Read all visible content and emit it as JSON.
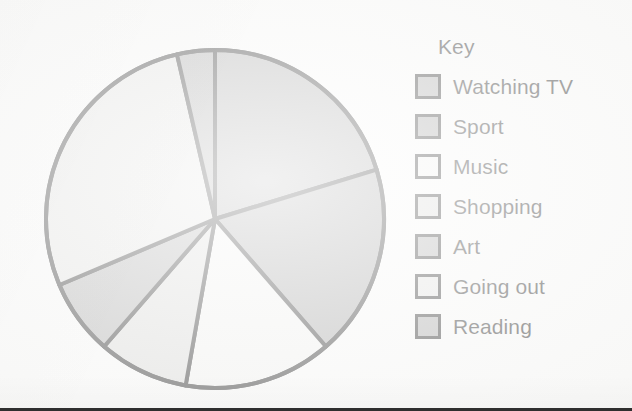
{
  "legend": {
    "title": "Key",
    "items": [
      {
        "label": "Watching TV",
        "swatch_color": "#a4a4a4"
      },
      {
        "label": "Sport",
        "swatch_color": "#9d9d9d"
      },
      {
        "label": "Music",
        "swatch_color": "#f4f4f2"
      },
      {
        "label": "Shopping",
        "swatch_color": "#d9d9d7"
      },
      {
        "label": "Art",
        "swatch_color": "#a7a7a7"
      },
      {
        "label": "Going out",
        "swatch_color": "#e2e2e0"
      },
      {
        "label": "Reading",
        "swatch_color": "#a2a2a2"
      }
    ]
  },
  "chart_data": {
    "type": "pie",
    "title": "",
    "legend_title": "Key",
    "legend_position": "right",
    "grid": false,
    "start_angle_deg": 0,
    "direction": "clockwise",
    "center_px": [
      214,
      219
    ],
    "radius_px": 171,
    "outline_color": "#111111",
    "outline_width_px": 4,
    "categories": [
      "Watching TV",
      "Sport",
      "Music",
      "Shopping",
      "Art",
      "Going out",
      "Reading"
    ],
    "angles_deg": [
      73,
      66,
      51,
      31,
      26,
      100,
      13
    ],
    "values_percent": [
      20.3,
      18.3,
      14.2,
      8.6,
      7.2,
      27.8,
      3.6
    ],
    "slice_boundaries_deg": [
      0,
      73,
      139,
      190,
      221,
      247,
      347,
      360
    ],
    "colors": [
      "#a4a4a4",
      "#9d9d9d",
      "#f4f4f2",
      "#d9d9d7",
      "#a7a7a7",
      "#e2e2e0",
      "#a2a2a2"
    ]
  }
}
